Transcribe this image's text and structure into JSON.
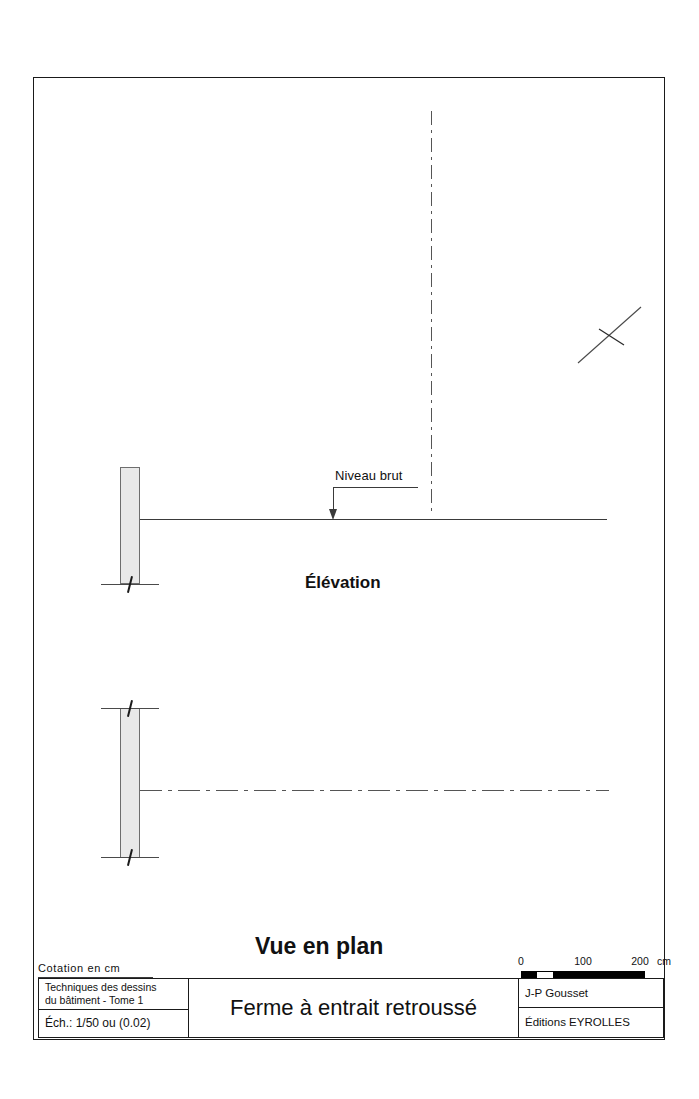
{
  "sheet": {
    "cotation_note": "Cotation  en  cm"
  },
  "drawing": {
    "elevation": {
      "caption": "Élévation",
      "level_note": "Niveau brut"
    },
    "plan": {
      "caption": "Vue en plan"
    }
  },
  "scalebar": {
    "unit": "cm",
    "ticks": [
      "0",
      "100",
      "200"
    ],
    "label_0": "0",
    "label_100": "100",
    "label_200": "200"
  },
  "cartouche": {
    "book_line1": "Techniques des dessins",
    "book_line2": "du bâtiment - Tome 1",
    "scale": "Éch.: 1/50 ou (0.02)",
    "title": "Ferme à entrait retroussé",
    "author": "J-P Gousset",
    "publisher": "Éditions EYROLLES"
  },
  "colors": {
    "ink": "#1a1a1a",
    "line": "#3a3a3a",
    "wall_fill": "#e9e9e9",
    "wall_stroke": "#6e6e6e",
    "centerline": "#555555",
    "paper": "#ffffff"
  }
}
